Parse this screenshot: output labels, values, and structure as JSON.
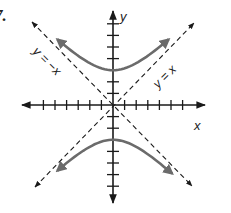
{
  "problem": {
    "number": "7."
  },
  "chart_data": {
    "type": "line",
    "title": "",
    "xlabel": "x",
    "ylabel": "y",
    "xlim": [
      -8,
      8
    ],
    "ylim": [
      -8,
      8
    ],
    "x_ticks": [
      -6,
      -5,
      -4,
      -3,
      -2,
      -1,
      1,
      2,
      3,
      4,
      5,
      6
    ],
    "y_ticks": [
      -7,
      -6,
      -5,
      -4,
      -3,
      -2,
      -1,
      1,
      2,
      3,
      4,
      5,
      6,
      7
    ],
    "grid": false,
    "series": [
      {
        "name": "upper branch",
        "equation": "y = sqrt(x^2 + 9)",
        "vertex": [
          0,
          3
        ],
        "x_range": [
          -4.8,
          4.8
        ],
        "style": "solid gray, arrows both ends"
      },
      {
        "name": "lower branch",
        "equation": "y = -sqrt(x^2 + 9)",
        "vertex": [
          0,
          -3
        ],
        "x_range": [
          -4.8,
          5.1
        ],
        "style": "solid gray, arrows both ends"
      },
      {
        "name": "asymptote y = x",
        "label": "y = x",
        "style": "dashed, arrows both ends"
      },
      {
        "name": "asymptote y = -x",
        "label": "y = −x",
        "style": "dashed, arrows both ends"
      }
    ],
    "annotations": [
      "y = −x",
      "y = x"
    ]
  },
  "labels": {
    "x_axis": "x",
    "y_axis": "y",
    "asymptote_pos": "y = x",
    "asymptote_neg": "y = −x"
  },
  "colors": {
    "axis": "#1a1a1a",
    "curve": "#6b6b6b",
    "asymptote": "#1a1a1a"
  }
}
